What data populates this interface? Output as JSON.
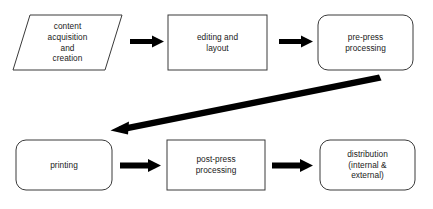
{
  "diagram": {
    "type": "flowchart",
    "background_color": "#ffffff",
    "stroke_color": "#3a3a3a",
    "arrow_color": "#000000",
    "text_color": "#1a1a1a",
    "nodes": [
      {
        "id": "content-acquisition",
        "label": "content\nacquisition\nand\ncreation",
        "shape": "parallelogram",
        "x": 13,
        "y": 15,
        "width": 109,
        "height": 55
      },
      {
        "id": "editing-layout",
        "label": "editing and\nlayout",
        "shape": "rectangle",
        "x": 168,
        "y": 15,
        "width": 99,
        "height": 55
      },
      {
        "id": "pre-press-processing",
        "label": "pre-press\nprocessing",
        "shape": "rounded-rectangle",
        "x": 318,
        "y": 15,
        "width": 95,
        "height": 55
      },
      {
        "id": "printing",
        "label": "printing",
        "shape": "rounded-rectangle",
        "x": 16,
        "y": 140,
        "width": 96,
        "height": 50
      },
      {
        "id": "post-press-processing",
        "label": "post-press\nprocessing",
        "shape": "rectangle",
        "x": 167,
        "y": 140,
        "width": 98,
        "height": 50
      },
      {
        "id": "distribution",
        "label": "distribution\n(internal &\nexternal)",
        "shape": "rounded-rectangle",
        "x": 320,
        "y": 140,
        "width": 95,
        "height": 50
      }
    ],
    "connectors": [
      {
        "id": "content-to-editing",
        "from": "content-acquisition",
        "to": "editing-layout",
        "style": "horizontal-arrow"
      },
      {
        "id": "editing-to-prepress",
        "from": "editing-layout",
        "to": "pre-press-processing",
        "style": "horizontal-arrow"
      },
      {
        "id": "prepress-to-printing",
        "from": "pre-press-processing",
        "to": "printing",
        "style": "diagonal-arrow"
      },
      {
        "id": "printing-to-postpress",
        "from": "printing",
        "to": "post-press-processing",
        "style": "horizontal-arrow"
      },
      {
        "id": "postpress-to-distribution",
        "from": "post-press-processing",
        "to": "distribution",
        "style": "horizontal-arrow"
      }
    ]
  }
}
